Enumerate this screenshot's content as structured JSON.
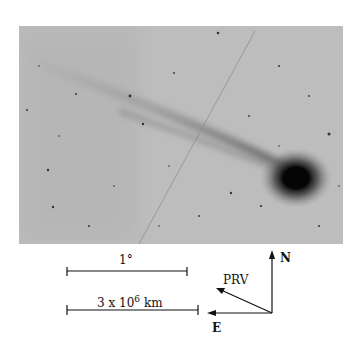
{
  "figure": {
    "type": "comet photograph",
    "scale_bars": [
      {
        "label": "1°"
      },
      {
        "label_base": "3 x 10",
        "label_exp": "6",
        "label_unit": "km"
      }
    ],
    "compass": {
      "north": "N",
      "east": "E",
      "velocity": "PRV"
    },
    "colors": {
      "sky": "#b9b9b9",
      "nucleus": "#0a0a0a",
      "ink": "#111111"
    }
  }
}
